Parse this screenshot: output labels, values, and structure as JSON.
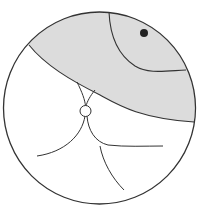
{
  "diagram": {
    "type": "stereonet-like circular projection",
    "colors": {
      "background": "#ffffff",
      "stroke": "#333333",
      "shaded_region": "#dcdcdc",
      "pole_point": "#222222"
    },
    "primitive_circle": {
      "cx": 99.5,
      "cy": 108,
      "r": 96
    },
    "shaded_region": {
      "label": ""
    },
    "pole_point": {
      "cx": 144,
      "cy": 33,
      "r": 4
    },
    "small_circle": {
      "cx": 85.5,
      "cy": 111,
      "r": 5.5
    }
  }
}
